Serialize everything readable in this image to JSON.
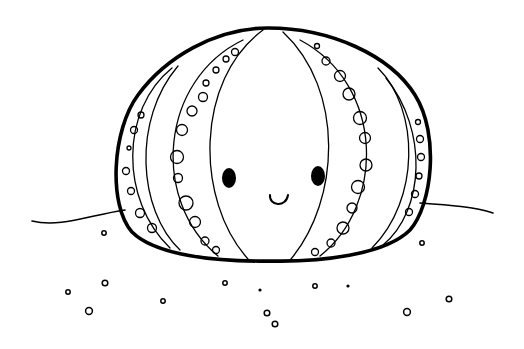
{
  "image": {
    "subject": "Cute sea urchin coloring page",
    "stroke_color": "#000000",
    "background_color": "#ffffff",
    "elements": [
      "sea-urchin-shell",
      "face",
      "sand-line",
      "sand-dots"
    ]
  },
  "sand_dots": [
    {
      "x": 104,
      "y": 233,
      "r": 2.2,
      "fill": false
    },
    {
      "x": 68,
      "y": 292,
      "r": 2.2,
      "fill": false
    },
    {
      "x": 105,
      "y": 283,
      "r": 2.8,
      "fill": false
    },
    {
      "x": 89,
      "y": 311,
      "r": 3.4,
      "fill": false
    },
    {
      "x": 163,
      "y": 301,
      "r": 2.2,
      "fill": false
    },
    {
      "x": 225,
      "y": 283,
      "r": 2.2,
      "fill": false
    },
    {
      "x": 260,
      "y": 290,
      "r": 1.6,
      "fill": true
    },
    {
      "x": 267,
      "y": 313,
      "r": 2.8,
      "fill": false
    },
    {
      "x": 275,
      "y": 324,
      "r": 2.8,
      "fill": false
    },
    {
      "x": 315,
      "y": 286,
      "r": 2.2,
      "fill": false
    },
    {
      "x": 348,
      "y": 286,
      "r": 1.6,
      "fill": true
    },
    {
      "x": 422,
      "y": 243,
      "r": 2.2,
      "fill": false
    },
    {
      "x": 407,
      "y": 312,
      "r": 3.4,
      "fill": false
    },
    {
      "x": 449,
      "y": 299,
      "r": 2.8,
      "fill": false
    }
  ]
}
